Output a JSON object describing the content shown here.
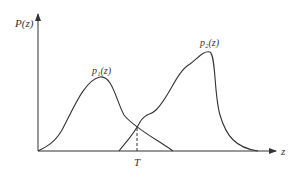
{
  "diagram": {
    "y_axis_label": "P(z)",
    "x_axis_label": "z",
    "curve1_label": "p₁(z)",
    "curve2_label": "p₂(z)",
    "threshold_label": "T",
    "line_color": "#333333"
  }
}
